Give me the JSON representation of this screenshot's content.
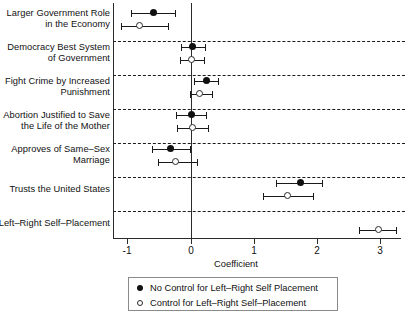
{
  "chart_data": {
    "type": "scatter",
    "title": "",
    "xlabel": "Coefficient",
    "ylabel": "",
    "xlim": [
      -1.28,
      3.31
    ],
    "xticks": [
      -1,
      0,
      1,
      2,
      3
    ],
    "xticklabels": [
      "-1",
      "0",
      "1",
      "2",
      "3"
    ],
    "grid": false,
    "reference_line": 0,
    "legend_position": "bottom-center",
    "categories": [
      "Larger Government Role in the Economy",
      "Democracy Best System of Government",
      "Fight Crime by Increased Punishment",
      "Abortion Justified to Save the Life of the Mother",
      "Approves of Same-Sex Marriage",
      "Trusts the United States",
      "Left-Right Self-Placement"
    ],
    "series": [
      {
        "name": "No Control for Left–Right Self Placement",
        "marker": "filled-circle",
        "color": "#111111",
        "values": [
          -0.6,
          0.02,
          0.25,
          0.01,
          -0.33,
          1.73,
          null
        ],
        "ci_lower": [
          -0.94,
          -0.16,
          0.05,
          -0.23,
          -0.61,
          1.35,
          null
        ],
        "ci_upper": [
          -0.26,
          0.22,
          0.43,
          0.24,
          -0.02,
          2.07,
          null
        ]
      },
      {
        "name": "Control for Left–Right Self–Placement",
        "marker": "open-circle",
        "color": "#2a2a2a",
        "values": [
          -0.82,
          0.0,
          0.14,
          0.03,
          -0.25,
          1.53,
          2.96
        ],
        "ci_lower": [
          -1.1,
          -0.18,
          -0.01,
          -0.22,
          -0.52,
          1.13,
          2.66
        ],
        "ci_upper": [
          -0.36,
          0.21,
          0.33,
          0.27,
          0.1,
          1.92,
          3.24
        ]
      }
    ]
  },
  "ylabels": [
    [
      "Larger Government Role",
      "in the Economy"
    ],
    [
      "Democracy Best System",
      "of Government"
    ],
    [
      "Fight Crime by Increased",
      "Punishment"
    ],
    [
      "Abortion Justified to Save",
      "the Life of the Mother"
    ],
    [
      "Approves of Same–Sex",
      "Marriage"
    ],
    [
      "Trusts the United States"
    ],
    [
      "Left–Right Self–Placement"
    ]
  ],
  "axis": {
    "x_title": "Coefficient",
    "tick_labels": [
      "-1",
      "0",
      "1",
      "2",
      "3"
    ]
  },
  "legend": {
    "entries": [
      {
        "marker": "filled-circle",
        "label": "No Control for Left–Right Self Placement"
      },
      {
        "marker": "open-circle",
        "label": "Control for Left–Right Self–Placement"
      }
    ]
  }
}
